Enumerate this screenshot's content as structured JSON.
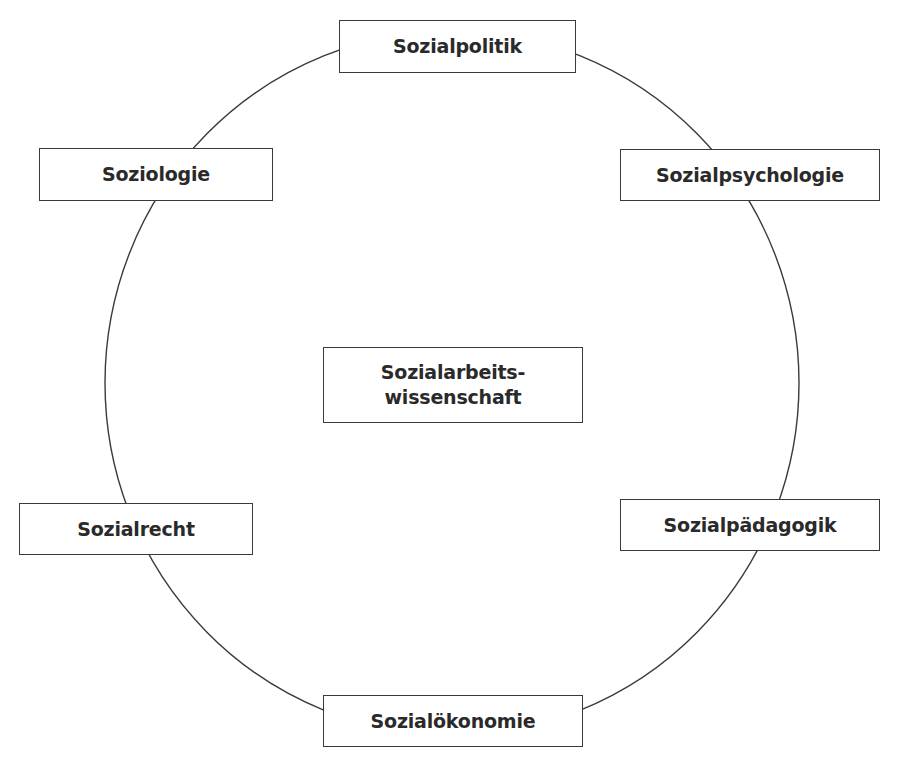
{
  "diagram": {
    "center": {
      "label": "Sozialarbeits-\nwissenschaft"
    },
    "nodes": [
      {
        "id": "sozialpolitik",
        "label": "Sozialpolitik"
      },
      {
        "id": "soziologie",
        "label": "Soziologie"
      },
      {
        "id": "sozialpsychologie",
        "label": "Sozialpsychologie"
      },
      {
        "id": "sozialrecht",
        "label": "Sozialrecht"
      },
      {
        "id": "sozialpaedagogik",
        "label": "Sozialpädagogik"
      },
      {
        "id": "sozialoekonomie",
        "label": "Sozialökonomie"
      }
    ],
    "colors": {
      "line": "#3a3a3a",
      "text": "#2a2a2a",
      "background": "#ffffff"
    }
  }
}
